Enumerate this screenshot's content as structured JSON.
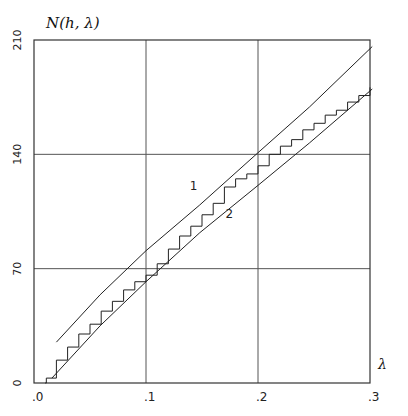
{
  "chart_data": {
    "type": "line",
    "title": "",
    "ylabel": "N(h, λ)",
    "xlabel": "λ",
    "xlim": [
      0,
      0.3
    ],
    "ylim": [
      0,
      210
    ],
    "x_ticks": [
      ".0",
      ".1",
      ".2",
      ".3"
    ],
    "x_tick_values": [
      0,
      0.1,
      0.2,
      0.3
    ],
    "y_ticks": [
      "0",
      "70",
      "140",
      "210"
    ],
    "y_tick_values": [
      0,
      70,
      140,
      210
    ],
    "grid": true,
    "legend": "none (curves labeled inline '1' and '2')",
    "annotations": [
      {
        "text": "1",
        "x": 0.139,
        "y": 118
      },
      {
        "text": "2",
        "x": 0.171,
        "y": 101
      }
    ],
    "series": [
      {
        "name": "1",
        "style": "smooth",
        "x": [
          0.02,
          0.059,
          0.1,
          0.148,
          0.2,
          0.246,
          0.302
        ],
        "y": [
          25,
          54,
          81,
          109,
          141,
          169,
          206
        ]
      },
      {
        "name": "2",
        "style": "smooth",
        "x": [
          0.016,
          0.059,
          0.1,
          0.148,
          0.2,
          0.246,
          0.302
        ],
        "y": [
          3,
          35,
          62,
          92,
          121,
          147,
          180
        ]
      },
      {
        "name": "staircase",
        "style": "step",
        "x": [
          0.01,
          0.011,
          0.02,
          0.03,
          0.04,
          0.05,
          0.06,
          0.07,
          0.08,
          0.09,
          0.1,
          0.11,
          0.12,
          0.13,
          0.14,
          0.15,
          0.16,
          0.17,
          0.18,
          0.19,
          0.2,
          0.21,
          0.22,
          0.23,
          0.24,
          0.25,
          0.26,
          0.27,
          0.28,
          0.29,
          0.3
        ],
        "y": [
          0,
          3,
          14,
          22,
          30,
          36,
          44,
          50,
          57,
          62,
          66,
          73,
          82,
          90,
          96,
          103,
          110,
          120,
          125,
          128,
          133,
          140,
          145,
          149,
          155,
          159,
          164,
          167,
          172,
          176,
          181
        ]
      }
    ]
  }
}
